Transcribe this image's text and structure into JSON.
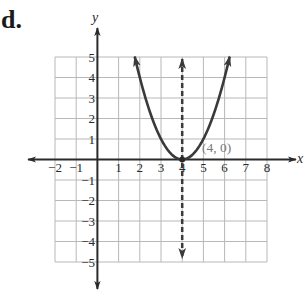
{
  "problem": {
    "label": "d."
  },
  "axes": {
    "x_label": "x",
    "y_label": "y",
    "x_ticks": [
      "−2",
      "−1",
      "1",
      "2",
      "3",
      "4",
      "5",
      "6",
      "7",
      "8"
    ],
    "y_ticks": [
      "5",
      "4",
      "3",
      "2",
      "1",
      "−1",
      "−2",
      "−3",
      "−4",
      "−5"
    ]
  },
  "annotations": {
    "vertex_label": "(4, 0)"
  },
  "colors": {
    "curve": "#3a3a3a",
    "axis": "#2a2a2a",
    "grid": "#b8b8b8",
    "label_gray": "#7a7a7a"
  },
  "chart_data": {
    "type": "line",
    "title": "",
    "xlabel": "x",
    "ylabel": "y",
    "xlim": [
      -2,
      8
    ],
    "ylim": [
      -5,
      5
    ],
    "grid": true,
    "x_ticks": [
      -2,
      -1,
      1,
      2,
      3,
      4,
      5,
      6,
      7,
      8
    ],
    "y_ticks": [
      -5,
      -4,
      -3,
      -2,
      -1,
      1,
      2,
      3,
      4,
      5
    ],
    "series": [
      {
        "name": "parabola y = (x − 4)^2",
        "style": "solid, arrows at both ends",
        "x": [
          1.76,
          2,
          2.5,
          3,
          3.5,
          4,
          4.5,
          5,
          5.5,
          6,
          6.24
        ],
        "y": [
          5.0,
          4,
          2.25,
          1,
          0.25,
          0,
          0.25,
          1,
          2.25,
          4,
          5.0
        ]
      },
      {
        "name": "axis of symmetry x = 4",
        "style": "dashed, arrows at both ends",
        "x": [
          4,
          4
        ],
        "y": [
          -5,
          5
        ]
      }
    ],
    "annotations": [
      {
        "text": "(4, 0)",
        "x": 4,
        "y": 0,
        "marker": "point"
      }
    ]
  }
}
